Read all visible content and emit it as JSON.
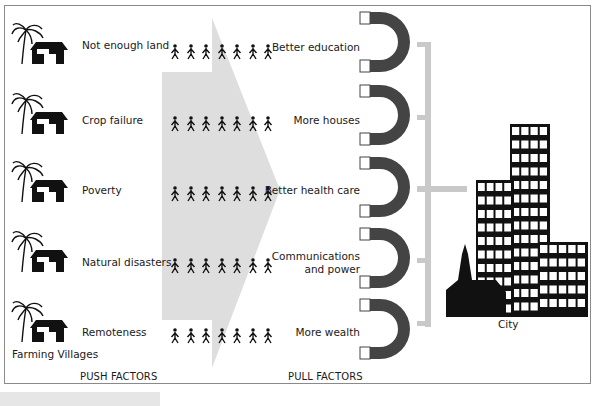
{
  "diagram": {
    "type": "push-pull migration diagram",
    "colors": {
      "arrow_fill": "#dcdcdc",
      "connector": "#c8c8c8",
      "magnet": "#444444",
      "icon": "#111111",
      "frame_border": "#8a8a8a"
    },
    "villages": {
      "label": "Farming Villages",
      "push_factors": [
        {
          "label": "Not enough land"
        },
        {
          "label": "Crop failure"
        },
        {
          "label": "Poverty"
        },
        {
          "label": "Natural disasters"
        },
        {
          "label": "Remoteness"
        }
      ]
    },
    "migrants_per_row": 7,
    "pull_factors": [
      {
        "label": "Better education"
      },
      {
        "label": "More houses"
      },
      {
        "label": "Better health care"
      },
      {
        "label": "Communications",
        "label2": "and power"
      },
      {
        "label": "More wealth"
      }
    ],
    "city": {
      "label": "City"
    },
    "footer": {
      "push_label": "PUSH FACTORS",
      "pull_label": "PULL FACTORS"
    }
  }
}
